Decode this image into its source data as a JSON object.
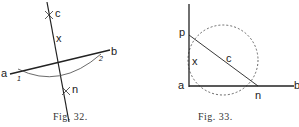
{
  "figures": [
    {
      "caption": "Fig. 32.",
      "labels": {
        "c": "c",
        "x": "x",
        "a": "a",
        "b": "b",
        "one": "1",
        "two": "2",
        "n": "n"
      }
    },
    {
      "caption": "Fig. 33.",
      "labels": {
        "p": "p",
        "x": "x",
        "c": "c",
        "a": "a",
        "n": "n",
        "b": "b"
      }
    }
  ],
  "colors": {
    "ink": "#222222",
    "paper": "#ffffff"
  }
}
